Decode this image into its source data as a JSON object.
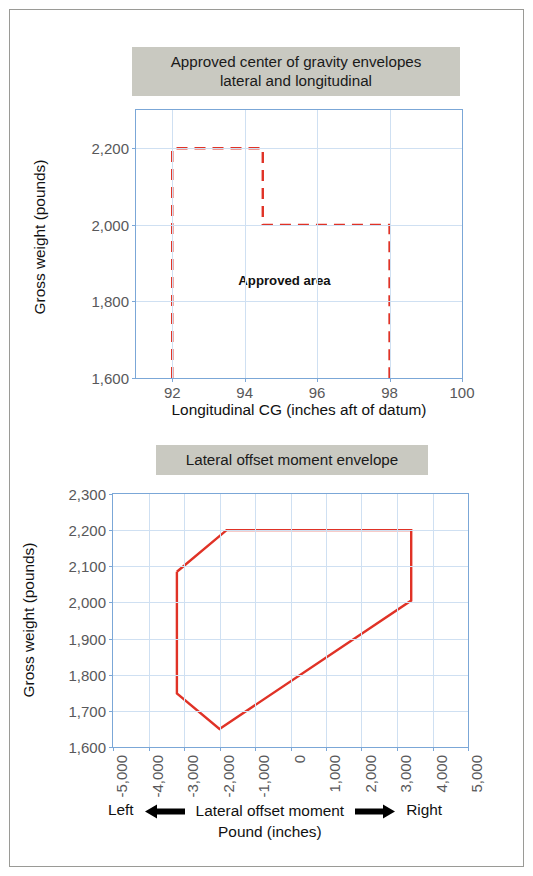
{
  "page": {
    "border_color": "#9a9a96",
    "background": "#ffffff"
  },
  "chart1": {
    "title_line1": "Approved center of gravity envelopes",
    "title_line2": "lateral and longitudinal",
    "title_band_color": "#c9c9c1",
    "annotation": "Approved area",
    "ylabel": "Gross weight (pounds)",
    "xlabel": "Longitudinal CG (inches aft of datum)"
  },
  "chart2": {
    "title": "Lateral offset moment envelope",
    "title_band_color": "#c9c9c1",
    "ylabel": "Gross weight (pounds)",
    "xlabel_line1": "Lateral offset moment",
    "xlabel_line2": "Pound (inches)",
    "left_label": "Left",
    "right_label": "Right"
  },
  "chart_data": [
    {
      "type": "line",
      "id": "approved-cg-envelope",
      "title": "Approved center of gravity envelopes lateral and longitudinal",
      "xlabel": "Longitudinal CG (inches aft of datum)",
      "ylabel": "Gross weight (pounds)",
      "xlim": [
        91,
        100
      ],
      "ylim": [
        1600,
        2300
      ],
      "xticks": [
        92,
        94,
        96,
        98,
        100
      ],
      "xtick_labels": [
        "92",
        "94",
        "96",
        "98",
        "100"
      ],
      "yticks": [
        1600,
        1800,
        2000,
        2200
      ],
      "ytick_labels": [
        "1,600",
        "1,800",
        "2,000",
        "2,200"
      ],
      "grid": true,
      "legend": "none",
      "line_color": "#e03226",
      "line_style": "dashed",
      "annotations": [
        {
          "text": "Approved area",
          "x": 95.1,
          "y": 1855
        }
      ],
      "series": [
        {
          "name": "Approved envelope",
          "x": [
            92,
            92,
            94.5,
            94.5,
            98,
            98
          ],
          "y": [
            1600,
            2200,
            2200,
            2000,
            2000,
            1600
          ]
        }
      ]
    },
    {
      "type": "line",
      "id": "lateral-offset-moment-envelope",
      "title": "Lateral offset moment envelope",
      "xlabel": "Lateral offset moment Pound (inches)",
      "ylabel": "Gross weight (pounds)",
      "xlim": [
        -5000,
        5000
      ],
      "ylim": [
        1600,
        2300
      ],
      "xticks": [
        -5000,
        -4000,
        -3000,
        -2000,
        -1000,
        0,
        1000,
        2000,
        3000,
        4000,
        5000
      ],
      "xtick_labels": [
        "-5,000",
        "-4,000",
        "-3,000",
        "-2,000",
        "-1,000",
        "0",
        "1,000",
        "2,000",
        "3,000",
        "4,000",
        "5,000"
      ],
      "yticks": [
        1600,
        1700,
        1800,
        1900,
        2000,
        2100,
        2200,
        2300
      ],
      "ytick_labels": [
        "1,600",
        "1,700",
        "1,800",
        "1,900",
        "2,000",
        "2,100",
        "2,200",
        "2,300"
      ],
      "grid": true,
      "legend": "none",
      "line_color": "#e03226",
      "line_style": "solid",
      "series": [
        {
          "name": "Lateral envelope",
          "closed": true,
          "x": [
            -3200,
            -1800,
            3400,
            3400,
            -2000,
            -3200,
            -3200
          ],
          "y": [
            2085,
            2200,
            2200,
            2005,
            1650,
            1748,
            2085
          ]
        }
      ]
    }
  ]
}
